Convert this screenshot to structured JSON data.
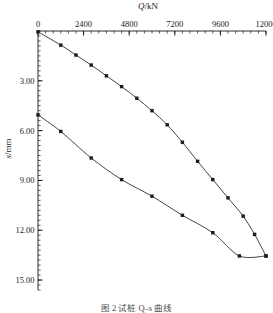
{
  "figure": {
    "caption": "图 2  试桩 Q–s 曲线"
  },
  "chart_data": {
    "type": "line",
    "title": "",
    "xlabel": "Q/kN",
    "ylabel": "s/mm",
    "xlim": [
      0,
      12000
    ],
    "ylim": [
      0,
      15.6
    ],
    "y_axis_inverted": true,
    "x_axis_position": "top",
    "grid": false,
    "legend": null,
    "xticks": [
      0,
      2400,
      4800,
      7200,
      9600,
      12000
    ],
    "xtick_labels": [
      "0",
      "2400",
      "4800",
      "7200",
      "9600",
      "12000"
    ],
    "yticks": [
      3.0,
      6.0,
      9.0,
      12.0,
      15.0
    ],
    "ytick_labels": [
      "3.00",
      "6.00",
      "9.00",
      "12.00",
      "15.00"
    ],
    "x_minor_tick_step": 400,
    "y_minor_tick_step": 0.3,
    "marker": "square",
    "marker_color": "#1a1a1a",
    "line_color": "#3a3a3a",
    "series": [
      {
        "name": "加载曲线",
        "points": [
          [
            0,
            0.05
          ],
          [
            1200,
            0.85
          ],
          [
            2000,
            1.45
          ],
          [
            2800,
            2.05
          ],
          [
            3600,
            2.7
          ],
          [
            4400,
            3.35
          ],
          [
            5200,
            4.05
          ],
          [
            6000,
            4.8
          ],
          [
            6800,
            5.65
          ],
          [
            7600,
            6.7
          ],
          [
            8400,
            7.85
          ],
          [
            9200,
            8.95
          ],
          [
            10000,
            10.05
          ],
          [
            10800,
            11.15
          ],
          [
            11400,
            12.25
          ],
          [
            12000,
            13.55
          ]
        ]
      },
      {
        "name": "卸载回弹曲线",
        "points": [
          [
            0,
            5.05
          ],
          [
            1200,
            6.05
          ],
          [
            2800,
            7.65
          ],
          [
            4400,
            8.95
          ],
          [
            6000,
            9.95
          ],
          [
            7600,
            11.1
          ],
          [
            9200,
            12.15
          ],
          [
            10600,
            13.55
          ],
          [
            12000,
            13.55
          ]
        ]
      }
    ]
  }
}
